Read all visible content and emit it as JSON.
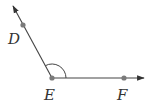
{
  "diagram": {
    "type": "angle",
    "colors": {
      "line": "#444444",
      "point": "#7a7a7a",
      "label": "#333333"
    },
    "points": [
      {
        "name": "D",
        "label": "D",
        "x": 23,
        "y": 25,
        "label_x": 8,
        "label_y": 44
      },
      {
        "name": "E",
        "label": "E",
        "x": 52,
        "y": 78,
        "label_x": 44,
        "label_y": 100
      },
      {
        "name": "F",
        "label": "F",
        "x": 124,
        "y": 78,
        "label_x": 117,
        "label_y": 100
      }
    ],
    "rays": [
      {
        "from": "E",
        "through": "D",
        "arrow_tip": [
          12,
          4
        ]
      },
      {
        "from": "E",
        "through": "F",
        "arrow_tip": [
          145,
          78
        ]
      }
    ],
    "angle_marker": {
      "vertex": "E",
      "between": [
        "D",
        "F"
      ],
      "radius": 14
    }
  }
}
